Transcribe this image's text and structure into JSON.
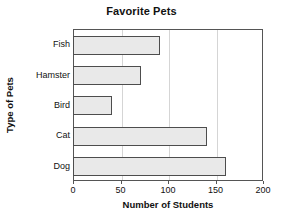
{
  "chart_data": {
    "type": "bar",
    "orientation": "horizontal",
    "title": "Favorite Pets",
    "xlabel": "Number of Students",
    "ylabel": "Type of Pets",
    "categories": [
      "Fish",
      "Hamster",
      "Bird",
      "Cat",
      "Dog"
    ],
    "values": [
      90,
      70,
      40,
      140,
      160
    ],
    "xlim": [
      0,
      200
    ],
    "xticks": [
      0,
      50,
      100,
      150,
      200
    ],
    "xtick_labels": [
      "0",
      "50",
      "100",
      "150",
      "200"
    ],
    "grid": "vertical",
    "legend": "none",
    "colors": {
      "bar_fill": "#e9e9e9",
      "bar_edge": "#4d4d4d",
      "gridline": "#d5d5d5",
      "axis": "#555555",
      "text": "#111111",
      "background": "#ffffff"
    }
  }
}
